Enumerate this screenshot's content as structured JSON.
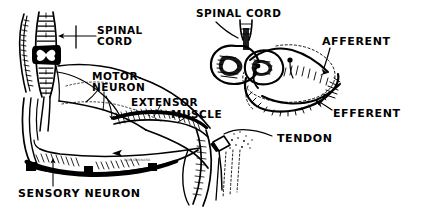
{
  "figure": {
    "background_color": "#ffffff",
    "ink_color": "#000000",
    "style": "hand-drawn pen and ink anatomical illustration"
  },
  "left_panel": {
    "name": "arm-reflex-arc-illustration",
    "labels": {
      "spinal_cord_line1": "SPINAL",
      "spinal_cord_line2": "CORD",
      "motor_neuron_line1": "MOTOR",
      "motor_neuron_line2": "NEURON",
      "extensor": "EXTENSOR",
      "muscle": "MUSCLE",
      "sensory_neuron": "SENSORY NEURON"
    }
  },
  "right_panel": {
    "name": "spinal-cord-cross-section-illustration",
    "labels": {
      "spinal_cord": "SPINAL CORD",
      "afferent": "AFFERENT",
      "efferent": "EFFERENT",
      "tendon": "TENDON"
    }
  },
  "artist_signature": "BOB GUNNARD"
}
